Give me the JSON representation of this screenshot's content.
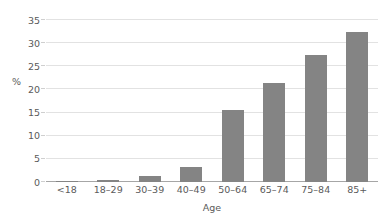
{
  "chart_data": {
    "type": "bar",
    "title": "",
    "subtitle": "",
    "xlabel": "Age",
    "ylabel": "%",
    "categories": [
      "<18",
      "18–29",
      "30–39",
      "40–49",
      "50–64",
      "65–74",
      "75–84",
      "85+"
    ],
    "values": [
      0.1,
      0.5,
      1.4,
      3.3,
      15.5,
      21.5,
      27.5,
      32.5
    ],
    "ylim": [
      0,
      35
    ],
    "yticks": [
      0,
      5,
      10,
      15,
      20,
      25,
      30,
      35
    ],
    "ytick_labels": [
      "0",
      "5",
      "10",
      "15",
      "20",
      "25",
      "30",
      "35"
    ],
    "grid": true,
    "grid_axis": "y",
    "legend": false,
    "legend_position": "none",
    "bar_color": "#848484",
    "gridline_color": "#e2e2e2",
    "axis_color": "#a6a6a6",
    "text_color": "#5a5a5a",
    "background_color": "#ffffff"
  }
}
